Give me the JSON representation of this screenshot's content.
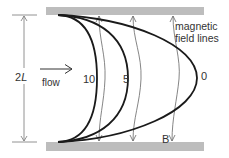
{
  "diagram": {
    "labels": {
      "dimension_number": "2",
      "dimension_var": "L",
      "flow": "flow",
      "field_lines_line1": "magnetic",
      "field_lines_line2": "field lines",
      "field_symbol": "B"
    },
    "profiles": [
      {
        "label": "10",
        "description": "Hartmann number 10, flattest profile"
      },
      {
        "label": "5",
        "description": "Hartmann number 5"
      },
      {
        "label": "0",
        "description": "Hartmann number 0, parabolic profile"
      }
    ],
    "colors": {
      "plate": "#bdbdbd",
      "profile_curve": "#1a1a1a",
      "field_line": "#666666",
      "dimension_line": "#777777",
      "text": "#333333"
    }
  }
}
